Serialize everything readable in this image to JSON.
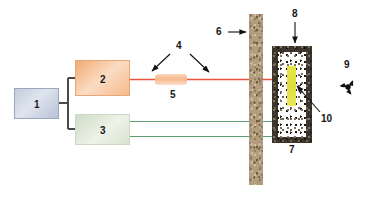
{
  "diagram": {
    "background_color": "#ffffff",
    "width": 371,
    "height": 199
  },
  "components": {
    "item_1": {
      "label": "1",
      "name": "power-supply-control-unit",
      "fill_color": "#cdd6e5",
      "border_color": "#9aa8bd"
    },
    "item_2": {
      "label": "2",
      "name": "laser-source-unit",
      "fill_color": "#f6bd93",
      "border_color": "#e8a777"
    },
    "item_3": {
      "label": "3",
      "name": "secondary-source-unit",
      "fill_color": "#dde6d4",
      "border_color": "#cdd9c6"
    },
    "item_4": {
      "label": "4",
      "name": "beam-path-pointer"
    },
    "item_5": {
      "label": "5",
      "name": "optical-lens-element",
      "fill_color": "#f7b78d"
    },
    "item_6": {
      "label": "6",
      "name": "shielding-wall",
      "fill_color": "#b39d7e"
    },
    "item_7": {
      "label": "7",
      "name": "fiber-optic-probe-lines",
      "line_color": "#5c9e74"
    },
    "item_8": {
      "label": "8",
      "name": "shielded-enclosure",
      "border_color": "#3b352c"
    },
    "item_9": {
      "label": "9",
      "name": "radiation-hazard-symbol",
      "glyph": "radiation-trefoil-icon",
      "color": "#111111"
    },
    "item_10": {
      "label": "10",
      "name": "radioactive-sample",
      "fill_color": "#e3e146"
    }
  },
  "beams": {
    "laser_beam": {
      "name": "red-laser-beam",
      "color": "#e8553c"
    },
    "probe_beam_upper": {
      "name": "upper-green-probe-line",
      "color": "#5c9e74"
    },
    "probe_beam_lower": {
      "name": "lower-green-probe-line",
      "color": "#5c9e74"
    },
    "connector": {
      "name": "unit-1-splitter-cable",
      "color": "#4a4a4a"
    }
  }
}
